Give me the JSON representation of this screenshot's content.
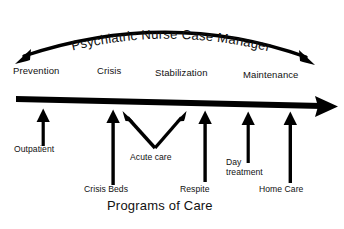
{
  "figure": {
    "background_color": "#ffffff",
    "ink_color": "#000000",
    "caption": "Programs of Care",
    "arc_label": "Psychiatric Nurse Case Manager"
  },
  "stages": {
    "heading_note": "continuum stages along the horizontal timeline arrow",
    "items": [
      {
        "label": "Prevention"
      },
      {
        "label": "Crisis"
      },
      {
        "label": "Stabilization"
      },
      {
        "label": "Maintenance"
      }
    ]
  },
  "programs": {
    "items": [
      {
        "label": "Outpatient"
      },
      {
        "label": "Crisis Beds"
      },
      {
        "label": "Acute care"
      },
      {
        "label": "Respite"
      },
      {
        "label": "Day",
        "label2": "treatment"
      },
      {
        "label": "Home Care"
      }
    ]
  },
  "icons": {
    "arc_arrow": "double-headed-arc-arrow",
    "timeline_arrow": "right-arrow",
    "program_arrow": "up-arrow",
    "acute_care_arrows": "v-shaped-double-arrow"
  }
}
